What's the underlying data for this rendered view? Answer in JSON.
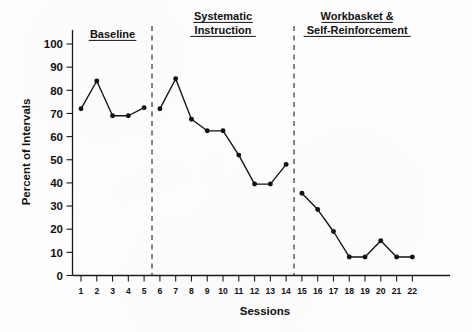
{
  "chart_data": {
    "type": "line",
    "title": "",
    "xlabel": "Sessions",
    "ylabel": "Percent of Intervals",
    "ylim": [
      0,
      105
    ],
    "yticks": [
      0,
      10,
      20,
      30,
      40,
      50,
      60,
      70,
      80,
      90,
      100
    ],
    "ytick_labels": [
      "0",
      "10",
      "20",
      "30",
      "40",
      "50",
      "60",
      "70",
      "80",
      "90",
      "100"
    ],
    "xticks": [
      1,
      2,
      3,
      4,
      5,
      6,
      7,
      8,
      9,
      10,
      11,
      12,
      13,
      14,
      15,
      16,
      17,
      18,
      19,
      20,
      21,
      22
    ],
    "xtick_labels": [
      "1",
      "2",
      "3",
      "4",
      "5",
      "6",
      "7",
      "8",
      "9",
      "10",
      "11",
      "12",
      "13",
      "14",
      "15",
      "16",
      "17",
      "18",
      "19",
      "20",
      "21",
      "22"
    ],
    "grid": false,
    "legend": "none",
    "marker": "filled-circle",
    "line_color": "#111111",
    "marker_color": "#111111",
    "series": [
      {
        "name": "Percent of Intervals",
        "x": [
          1,
          2,
          3,
          4,
          5
        ],
        "values": [
          72,
          84,
          69,
          69,
          72.5
        ],
        "phase": "Baseline"
      },
      {
        "name": "Percent of Intervals",
        "x": [
          6,
          7,
          8,
          9,
          10,
          11,
          12,
          13,
          14
        ],
        "values": [
          72,
          85,
          67.5,
          62.5,
          62.5,
          52,
          39.5,
          39.5,
          48
        ],
        "phase": "Systematic Instruction"
      },
      {
        "name": "Percent of Intervals",
        "x": [
          15,
          16,
          17,
          18,
          19,
          20,
          21,
          22
        ],
        "values": [
          35.5,
          28.5,
          19,
          8,
          8,
          15,
          8,
          8
        ],
        "phase": "Workbasket & Self-Reinforcement"
      }
    ],
    "phases": [
      {
        "label_line1": "Baseline",
        "label_line2": "",
        "start_x": 1,
        "end_x": 5
      },
      {
        "label_line1": "Systematic",
        "label_line2": "Instruction",
        "start_x": 6,
        "end_x": 14
      },
      {
        "label_line1": "Workbasket &",
        "label_line2": "Self-Reinforcement",
        "start_x": 15,
        "end_x": 22
      }
    ],
    "phase_dividers_between": [
      5.5,
      14.5
    ],
    "annotations": []
  }
}
